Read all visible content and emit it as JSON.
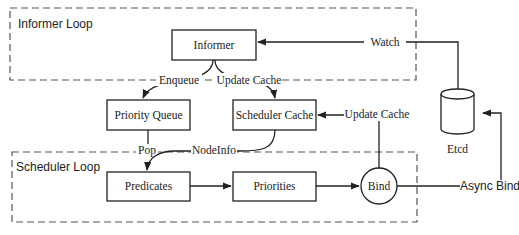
{
  "groups": {
    "informer_loop": {
      "label": "Informer Loop"
    },
    "scheduler_loop": {
      "label": "Scheduler Loop"
    }
  },
  "nodes": {
    "informer": "Informer",
    "priority_queue": "Priority Queue",
    "scheduler_cache": "Scheduler Cache",
    "predicates": "Predicates",
    "priorities": "Priorities",
    "bind": "Bind",
    "etcd": "Etcd"
  },
  "edges": {
    "watch": "Watch",
    "enqueue": "Enqueue",
    "update_cache_top": "Update Cache",
    "update_cache_right": "Update Cache",
    "pop": "Pop",
    "nodeinfo": "NodeInfo",
    "async_bind": "Async Bind"
  },
  "colors": {
    "stroke": "#222222",
    "dash": "#555555",
    "background": "#ffffff"
  }
}
